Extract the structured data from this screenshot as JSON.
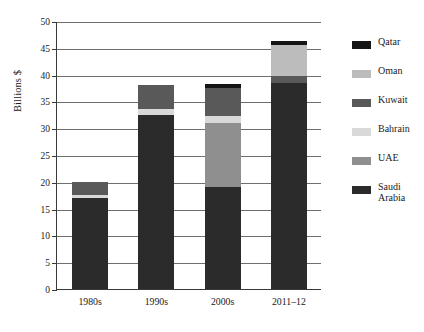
{
  "chart_data": {
    "type": "bar",
    "stacked": true,
    "title": "",
    "xlabel": "",
    "ylabel": "Billions $",
    "ylim": [
      0,
      50
    ],
    "ytick_step": 5,
    "ytick_labels": [
      "50",
      "45",
      "40",
      "35",
      "30",
      "25",
      "20",
      "15",
      "10",
      "5",
      "0"
    ],
    "grid": true,
    "legend_position": "right",
    "categories": [
      "1980s",
      "1990s",
      "2000s",
      "2011–12"
    ],
    "series": [
      {
        "name": "Saudi\nArabia",
        "legend_label": "Saudi\nArabia",
        "color": "#2b2b2b",
        "values": [
          17.0,
          32.5,
          19.0,
          38.5
        ]
      },
      {
        "name": "UAE",
        "legend_label": "UAE",
        "color": "#8f8f8f",
        "values": [
          0.0,
          0.0,
          12.0,
          0.0
        ]
      },
      {
        "name": "Bahrain",
        "legend_label": "Bahrain",
        "color": "#d9d9d9",
        "values": [
          0.6,
          1.0,
          1.2,
          0.0
        ]
      },
      {
        "name": "Kuwait",
        "legend_label": "Kuwait",
        "color": "#595959",
        "values": [
          2.4,
          4.5,
          5.3,
          1.2
        ]
      },
      {
        "name": "Oman",
        "legend_label": "Oman",
        "color": "#bcbcbc",
        "values": [
          0.0,
          0.0,
          0.0,
          5.8
        ]
      },
      {
        "name": "Qatar",
        "legend_label": "Qatar",
        "color": "#151515",
        "values": [
          0.0,
          0.0,
          0.7,
          0.7
        ]
      }
    ],
    "totals": [
      20.0,
      38.0,
      38.2,
      46.2
    ],
    "legend_order": [
      "Qatar",
      "Oman",
      "Kuwait",
      "Bahrain",
      "UAE",
      "Saudi\nArabia"
    ]
  },
  "legend": {
    "items": [
      {
        "label": "Qatar",
        "color": "#151515"
      },
      {
        "label": "Oman",
        "color": "#bcbcbc"
      },
      {
        "label": "Kuwait",
        "color": "#595959"
      },
      {
        "label": "Bahrain",
        "color": "#d9d9d9"
      },
      {
        "label": "UAE",
        "color": "#8f8f8f"
      },
      {
        "label": "Saudi\nArabia",
        "color": "#2b2b2b"
      }
    ]
  },
  "axis": {
    "y_label": "Billions $"
  },
  "caption": ""
}
